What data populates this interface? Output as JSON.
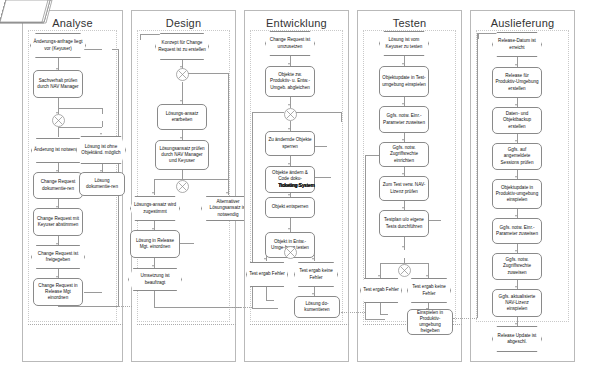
{
  "diagram": {
    "type": "epc-swimlane-flowchart",
    "lanes": [
      {
        "id": "analyse",
        "label": "Analyse",
        "nodes": [
          {
            "id": "a1",
            "kind": "event",
            "text": "Änderungs-anfrage liegt vor (Keyuser)"
          },
          {
            "id": "a2",
            "kind": "info",
            "text": "Ticketing System"
          },
          {
            "id": "a3",
            "kind": "function",
            "text": "Sachverhalt prüfen durch NAV Manager"
          },
          {
            "id": "a4",
            "kind": "xor",
            "text": "XOR"
          },
          {
            "id": "a5",
            "kind": "event",
            "text": "Änderung ist notwendig"
          },
          {
            "id": "a6",
            "kind": "event",
            "text": "Lösung ist ohne Objektänd. möglich"
          },
          {
            "id": "a7",
            "kind": "function",
            "text": "Change Request dokumentie-ren"
          },
          {
            "id": "a8",
            "kind": "function",
            "text": "Lösung dokumentie-ren"
          },
          {
            "id": "a9",
            "kind": "function",
            "text": "Change Request mit Keyuser abstimmen"
          },
          {
            "id": "a10",
            "kind": "event",
            "text": "Change Request ist freigegeben"
          },
          {
            "id": "a11",
            "kind": "function",
            "text": "Change Request in Release Mgt einordnen"
          },
          {
            "id": "a12",
            "kind": "info",
            "text": "Ticketing System"
          }
        ]
      },
      {
        "id": "design",
        "label": "Design",
        "nodes": [
          {
            "id": "d1",
            "kind": "event",
            "text": "Konzept für Change Request ist zu erstellen"
          },
          {
            "id": "d2",
            "kind": "xor",
            "text": "XOR"
          },
          {
            "id": "d3",
            "kind": "function",
            "text": "Lösungs-ansatz erarbeiten"
          },
          {
            "id": "d4",
            "kind": "function",
            "text": "Lösungsansatz prüfen durch NAV Manager und Keyuser"
          },
          {
            "id": "d5",
            "kind": "xor",
            "text": "XOR"
          },
          {
            "id": "d6",
            "kind": "event",
            "text": "Lösungs-ansatz wird zugestimmt"
          },
          {
            "id": "d7",
            "kind": "event",
            "text": "Alternativer Lösungsansatz ist notwendig"
          },
          {
            "id": "d8",
            "kind": "function",
            "text": "Lösung in Release Mgt. einordnen"
          },
          {
            "id": "d9",
            "kind": "info",
            "text": "Ticketing System"
          },
          {
            "id": "d10",
            "kind": "event",
            "text": "Umsetzung ist beauftragt"
          }
        ]
      },
      {
        "id": "entwicklung",
        "label": "Entwicklung",
        "nodes": [
          {
            "id": "e1",
            "kind": "event",
            "text": "Change Request ist umzusetzen"
          },
          {
            "id": "e2",
            "kind": "function",
            "text": "Objekte zw. Produktiv- u. Entw.-Umgeb. abgleichen"
          },
          {
            "id": "e3",
            "kind": "xor",
            "text": "XOR"
          },
          {
            "id": "e4",
            "kind": "function",
            "text": "Zu ändernde Objekte sperren"
          },
          {
            "id": "e5",
            "kind": "info",
            "text": "Ticketing System"
          },
          {
            "id": "e6",
            "kind": "function",
            "text": "Objekte ändern & Code doku-mentieren"
          },
          {
            "id": "e7",
            "kind": "function",
            "text": "Objekt entsperren"
          },
          {
            "id": "e8",
            "kind": "info",
            "text": "Ticketing System"
          },
          {
            "id": "e9",
            "kind": "function",
            "text": "Objekt in Entw.-Umge-bung testen"
          },
          {
            "id": "e10",
            "kind": "xor",
            "text": "XOR"
          },
          {
            "id": "e11",
            "kind": "event",
            "text": "Test ergab Fehler"
          },
          {
            "id": "e12",
            "kind": "event",
            "text": "Test ergab keine Fehler"
          },
          {
            "id": "e13",
            "kind": "info",
            "text": "Ticketing System"
          },
          {
            "id": "e14",
            "kind": "function",
            "text": "Lösung do-kumentieren"
          }
        ]
      },
      {
        "id": "testen",
        "label": "Testen",
        "nodes": [
          {
            "id": "t1",
            "kind": "event",
            "text": "Lösung ist vom Keyuser zu testen"
          },
          {
            "id": "t2",
            "kind": "function",
            "text": "Objektupdate in Test-umgebung einspielen"
          },
          {
            "id": "t3",
            "kind": "function",
            "text": "Ggfs. notw. Einr.-Parameter zuweisen"
          },
          {
            "id": "t4",
            "kind": "function",
            "text": "Ggfs. notw. Zugriffsrechte einrichten"
          },
          {
            "id": "t5",
            "kind": "function",
            "text": "Zum Test verw. NAV-Lizenz prüfen"
          },
          {
            "id": "t6",
            "kind": "function",
            "text": "Testplan u/o eigene Tests durchführen"
          },
          {
            "id": "t7",
            "kind": "info",
            "text": "Ticketing System"
          },
          {
            "id": "t8",
            "kind": "xor",
            "text": "XOR"
          },
          {
            "id": "t9",
            "kind": "event",
            "text": "Test ergab Fehler"
          },
          {
            "id": "t10",
            "kind": "event",
            "text": "Test ergab keine Fehler"
          },
          {
            "id": "t11",
            "kind": "info",
            "text": "Ticketing System"
          },
          {
            "id": "t12",
            "kind": "function",
            "text": "Einspielen in Produktiv-umgebung freigeben"
          }
        ]
      },
      {
        "id": "auslieferung",
        "label": "Auslieferung",
        "nodes": [
          {
            "id": "u1",
            "kind": "event",
            "text": "Release-Datum ist erreicht"
          },
          {
            "id": "u2",
            "kind": "function",
            "text": "Release für Produktiv-Umgebung erstellen"
          },
          {
            "id": "u3",
            "kind": "function",
            "text": "Daten- und Objektbackup erstellen"
          },
          {
            "id": "u4",
            "kind": "function",
            "text": "Ggfs. auf angemeldete Sessions prüfen"
          },
          {
            "id": "u5",
            "kind": "function",
            "text": "Objektupdate in Produktiv-umgebung einspielen"
          },
          {
            "id": "u6",
            "kind": "function",
            "text": "Ggfs. notw. Einr.-Parameter zuweisen"
          },
          {
            "id": "u7",
            "kind": "function",
            "text": "Ggfs. notw. Zugriffsrechte zuweisen"
          },
          {
            "id": "u8",
            "kind": "function",
            "text": "Ggfs. aktualisierte NAV-Lizenz einspielen"
          },
          {
            "id": "u9",
            "kind": "event",
            "text": "Release Update ist abgeschl."
          }
        ]
      }
    ],
    "colors": {
      "lane_border": "#b9b9b9",
      "node_border": "#8a8a8a",
      "connector": "#9a9a9a",
      "text": "#111111",
      "background": "#ffffff"
    }
  }
}
